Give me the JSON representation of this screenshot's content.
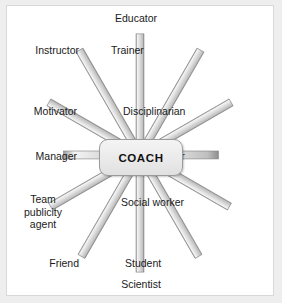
{
  "diagram": {
    "type": "radial-spoke",
    "center": {
      "label": "COACH"
    },
    "colors": {
      "page_background": "#eeeeee",
      "frame_background": "#ffffff",
      "frame_border": "#d8d8d8",
      "spoke_fill": "#d6d6d6",
      "spoke_highlight": "#f2f2f2",
      "spoke_shadow": "#8e8e8e",
      "center_fill": "#eaeaea",
      "center_border": "#9a9a9a",
      "text": "#1a1a1a"
    },
    "spokes": [
      {
        "label": "Educator",
        "angle_deg": 90,
        "position": "top"
      },
      {
        "label": "Trainer",
        "angle_deg": 60,
        "position": "upper-right"
      },
      {
        "label": "Disciplinarian",
        "angle_deg": 30,
        "position": "right-upper"
      },
      {
        "label": "Administrator",
        "angle_deg": 0,
        "position": "right"
      },
      {
        "label": "Social worker",
        "angle_deg": -30,
        "position": "right-lower"
      },
      {
        "label": "Student",
        "angle_deg": -60,
        "position": "lower-right"
      },
      {
        "label": "Scientist",
        "angle_deg": -90,
        "position": "bottom"
      },
      {
        "label": "Friend",
        "angle_deg": -120,
        "position": "lower-left"
      },
      {
        "label": "Team\npublicity\nagent",
        "angle_deg": -150,
        "position": "left-lower"
      },
      {
        "label": "Manager",
        "angle_deg": 180,
        "position": "left"
      },
      {
        "label": "Motivator",
        "angle_deg": 150,
        "position": "left-upper"
      },
      {
        "label": "Instructor",
        "angle_deg": 120,
        "position": "upper-left"
      }
    ]
  }
}
